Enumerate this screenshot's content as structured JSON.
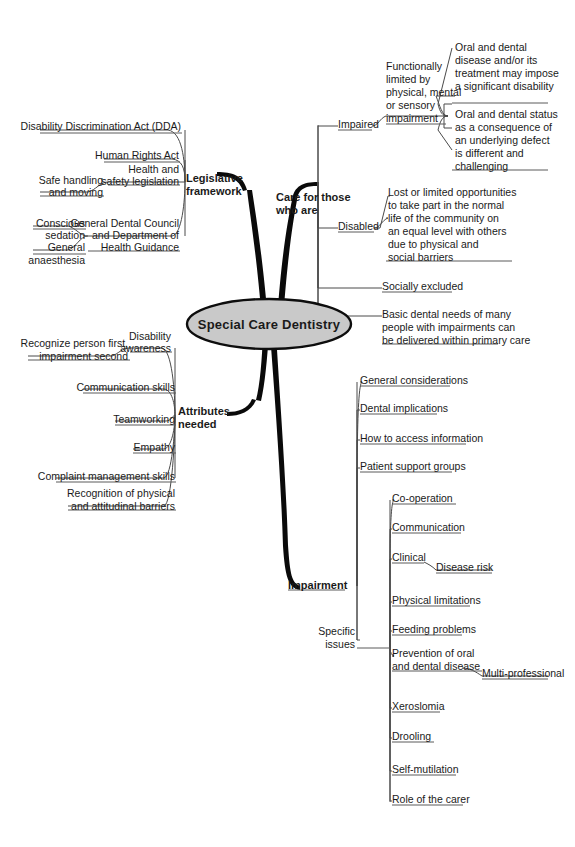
{
  "diagram": {
    "type": "mind-map",
    "title": "Special Care Dentistry",
    "root": {
      "label": "Special Care Dentistry"
    },
    "branches": [
      {
        "id": "legislative-framework",
        "label": "Legislative framework",
        "label_lines": [
          "Legislative",
          "framework"
        ],
        "side": "left",
        "children": [
          {
            "label": "Disability Discrimination Act (DDA)",
            "lines": [
              "Disability Discrimination Act (DDA)"
            ]
          },
          {
            "label": "Human Rights Act",
            "lines": [
              "Human Rights Act"
            ]
          },
          {
            "label": "Health and safety legislation",
            "lines": [
              "Health and",
              "safety legislation"
            ],
            "children": [
              {
                "label": "Safe handling and moving",
                "lines": [
                  "Safe handling",
                  "and moving"
                ]
              }
            ]
          },
          {
            "label": "General Dental Council and Department of Health Guidance",
            "lines": [
              "General Dental Council",
              "and Department of",
              "Health Guidance"
            ],
            "children": [
              {
                "label": "Conscious sedation",
                "lines": [
                  "Conscious",
                  "sedation"
                ]
              },
              {
                "label": "General anaesthesia",
                "lines": [
                  "General",
                  "anaesthesia"
                ]
              }
            ]
          }
        ]
      },
      {
        "id": "care-for-those-who-are",
        "label": "Care for those who are",
        "label_lines": [
          "Care for those",
          "who are"
        ],
        "side": "right",
        "children": [
          {
            "label": "Impaired",
            "lines": [
              "Impaired"
            ],
            "children": [
              {
                "label": "Functionally limited by physical, mental or sensory impairment",
                "lines": [
                  "Functionally",
                  "limited by",
                  "physical, mental",
                  "or sensory",
                  "impairment"
                ],
                "children": [
                  {
                    "label": "Oral and dental disease and/or its treatment may impose a significant disability",
                    "lines": [
                      "Oral and dental",
                      "disease and/or its",
                      "treatment may impose",
                      "a significant disability"
                    ]
                  },
                  {
                    "label": "Oral and dental status as a consequence of an underlying defect is different and challenging",
                    "lines": [
                      "Oral and dental status",
                      "as a consequence of",
                      "an underlying defect",
                      "is different and",
                      "challenging"
                    ]
                  }
                ]
              }
            ]
          },
          {
            "label": "Disabled",
            "lines": [
              "Disabled"
            ],
            "children": [
              {
                "label": "Lost or limited opportunities to take part in the normal life of the community on an equal level with others due to physical and social barriers",
                "lines": [
                  "Lost or limited opportunities",
                  "to take part in the normal",
                  "life of the community on",
                  "an equal level with others",
                  "due to physical and",
                  "social barriers"
                ]
              }
            ]
          },
          {
            "label": "Socially excluded",
            "lines": [
              "Socially excluded"
            ]
          },
          {
            "label": "Basic dental needs of many people with impairments can be delivered within primary care",
            "lines": [
              "Basic dental needs of many",
              "people with impairments can",
              "be delivered within primary care"
            ]
          }
        ]
      },
      {
        "id": "attributes-needed",
        "label": "Attributes needed",
        "label_lines": [
          "Attributes",
          "needed"
        ],
        "side": "left",
        "children": [
          {
            "label": "Disability awareness",
            "lines": [
              "Disability",
              "awareness"
            ],
            "children": [
              {
                "label": "Recognize person first, impairment second",
                "lines": [
                  "Recognize person first,",
                  "impairment second"
                ]
              }
            ]
          },
          {
            "label": "Communication skills",
            "lines": [
              "Communication skills"
            ]
          },
          {
            "label": "Teamworking",
            "lines": [
              "Teamworking"
            ]
          },
          {
            "label": "Empathy",
            "lines": [
              "Empathy"
            ]
          },
          {
            "label": "Complaint management skills",
            "lines": [
              "Complaint management skills"
            ]
          },
          {
            "label": "Recognition of physical and attitudinal barriers",
            "lines": [
              "Recognition of physical",
              "and attitudinal barriers"
            ]
          }
        ]
      },
      {
        "id": "impairment",
        "label": "Impairment",
        "label_lines": [
          "Impairment"
        ],
        "side": "right",
        "children": [
          {
            "label": "General considerations",
            "lines": [
              "General considerations"
            ]
          },
          {
            "label": "Dental implications",
            "lines": [
              "Dental implications"
            ]
          },
          {
            "label": "How to access information",
            "lines": [
              "How to access information"
            ]
          },
          {
            "label": "Patient support groups",
            "lines": [
              "Patient support groups"
            ]
          },
          {
            "label": "Specific issues",
            "lines": [
              "Specific",
              "issues"
            ],
            "children": [
              {
                "label": "Co-operation",
                "lines": [
                  "Co-operation"
                ]
              },
              {
                "label": "Communication",
                "lines": [
                  "Communication"
                ]
              },
              {
                "label": "Clinical",
                "lines": [
                  "Clinical"
                ],
                "children": [
                  {
                    "label": "Disease risk",
                    "lines": [
                      "Disease risk"
                    ]
                  }
                ]
              },
              {
                "label": "Physical limitations",
                "lines": [
                  "Physical limitations"
                ]
              },
              {
                "label": "Feeding problems",
                "lines": [
                  "Feeding problems"
                ]
              },
              {
                "label": "Prevention of oral and dental disease",
                "lines": [
                  "Prevention of oral",
                  "and dental disease"
                ],
                "children": [
                  {
                    "label": "Multi-professional",
                    "lines": [
                      "Multi-professional"
                    ]
                  }
                ]
              },
              {
                "label": "Xeroslomia",
                "lines": [
                  "Xeroslomia"
                ]
              },
              {
                "label": "Drooling",
                "lines": [
                  "Drooling"
                ]
              },
              {
                "label": "Self-mutilation",
                "lines": [
                  "Self-mutilation"
                ]
              },
              {
                "label": "Role of the carer",
                "lines": [
                  "Role of the carer"
                ]
              }
            ]
          }
        ]
      }
    ],
    "colors": {
      "background": "#ffffff",
      "root_fill": "#c9c9c9",
      "root_stroke": "#0d0d0d",
      "trunk": "#0a0a0a",
      "connector": "#4a4a4a",
      "text": "#1a1a1a"
    }
  }
}
